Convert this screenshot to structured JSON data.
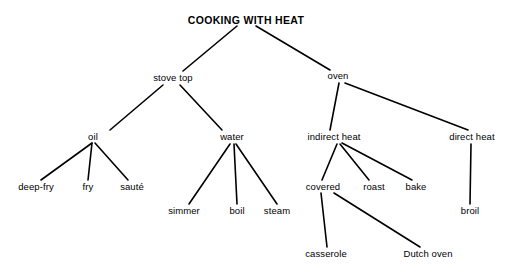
{
  "diagram": {
    "title": "COOKING WITH HEAT",
    "type": "tree-diagram",
    "background_color": "#ffffff",
    "line_color": "#000000",
    "text_color": "#000000",
    "width": 511,
    "height": 274,
    "nodes": [
      {
        "id": "cooking-with-heat",
        "label": "COOKING WITH HEAT",
        "level": 0,
        "x": 246,
        "y": 20,
        "anchor_x": 237,
        "anchor_y": 26
      },
      {
        "id": "stove-top",
        "label": "stove top",
        "level": 1,
        "x": 173,
        "y": 78,
        "anchor_x": 183,
        "anchor_y": 71,
        "parent_anchor_x": 163,
        "parent_anchor_y": 85
      },
      {
        "id": "oven",
        "label": "oven",
        "level": 1,
        "x": 338,
        "y": 76,
        "anchor_x": 330,
        "anchor_y": 70,
        "parent_anchor_x": 339,
        "parent_anchor_y": 83
      },
      {
        "id": "oil",
        "label": "oil",
        "level": 2,
        "x": 93,
        "y": 137,
        "anchor_x": 110,
        "anchor_y": 130,
        "parent_anchor_x": 92,
        "parent_anchor_y": 143
      },
      {
        "id": "water",
        "label": "water",
        "level": 2,
        "x": 232,
        "y": 137,
        "anchor_x": 222,
        "anchor_y": 130,
        "parent_anchor_x": 232,
        "parent_anchor_y": 144
      },
      {
        "id": "indirect-heat",
        "label": "indirect heat",
        "level": 2,
        "x": 334,
        "y": 137,
        "anchor_x": 330,
        "anchor_y": 130,
        "parent_anchor_x": 337,
        "parent_anchor_y": 144
      },
      {
        "id": "direct-heat",
        "label": "direct heat",
        "level": 2,
        "x": 472,
        "y": 137,
        "anchor_x": 462,
        "anchor_y": 130,
        "parent_anchor_x": 472,
        "parent_anchor_y": 144
      },
      {
        "id": "deep-fry",
        "label": "deep-fry",
        "level": 3,
        "x": 36,
        "y": 187,
        "anchor_x": 41,
        "anchor_y": 180
      },
      {
        "id": "fry",
        "label": "fry",
        "level": 3,
        "x": 88,
        "y": 187,
        "anchor_x": 88,
        "anchor_y": 180
      },
      {
        "id": "saute",
        "label": "sauté",
        "level": 3,
        "x": 132,
        "y": 187,
        "anchor_x": 128,
        "anchor_y": 180
      },
      {
        "id": "simmer",
        "label": "simmer",
        "level": 3,
        "x": 184,
        "y": 211,
        "anchor_x": 189,
        "anchor_y": 204
      },
      {
        "id": "boil",
        "label": "boil",
        "level": 3,
        "x": 237,
        "y": 211,
        "anchor_x": 237,
        "anchor_y": 204
      },
      {
        "id": "steam",
        "label": "steam",
        "level": 3,
        "x": 277,
        "y": 211,
        "anchor_x": 277,
        "anchor_y": 204
      },
      {
        "id": "covered",
        "label": "covered",
        "level": 3,
        "x": 323,
        "y": 187,
        "anchor_x": 323,
        "anchor_y": 180,
        "parent_anchor_x": 322,
        "parent_anchor_y": 193
      },
      {
        "id": "roast",
        "label": "roast",
        "level": 3,
        "x": 374,
        "y": 187,
        "anchor_x": 369,
        "anchor_y": 180
      },
      {
        "id": "bake",
        "label": "bake",
        "level": 3,
        "x": 416,
        "y": 187,
        "anchor_x": 412,
        "anchor_y": 180
      },
      {
        "id": "broil",
        "label": "broil",
        "level": 3,
        "x": 470,
        "y": 211,
        "anchor_x": 470,
        "anchor_y": 204
      },
      {
        "id": "casserole",
        "label": "casserole",
        "level": 4,
        "x": 326,
        "y": 254,
        "anchor_x": 327,
        "anchor_y": 247
      },
      {
        "id": "dutch-oven",
        "label": "Dutch oven",
        "level": 4,
        "x": 428,
        "y": 254,
        "anchor_x": 420,
        "anchor_y": 247
      }
    ],
    "edges": [
      {
        "from": "cooking-with-heat",
        "to": "stove-top",
        "x1": 237,
        "y1": 26,
        "x2": 183,
        "y2": 71
      },
      {
        "from": "cooking-with-heat",
        "to": "oven",
        "x1": 256,
        "y1": 26,
        "x2": 330,
        "y2": 70
      },
      {
        "from": "stove-top",
        "to": "oil",
        "x1": 163,
        "y1": 85,
        "x2": 110,
        "y2": 130
      },
      {
        "from": "stove-top",
        "to": "water",
        "x1": 180,
        "y1": 85,
        "x2": 222,
        "y2": 130
      },
      {
        "from": "oil",
        "to": "deep-fry",
        "x1": 92,
        "y1": 143,
        "x2": 41,
        "y2": 180
      },
      {
        "from": "oil",
        "to": "fry",
        "x1": 92,
        "y1": 143,
        "x2": 88,
        "y2": 180
      },
      {
        "from": "oil",
        "to": "saute",
        "x1": 95,
        "y1": 143,
        "x2": 128,
        "y2": 180
      },
      {
        "from": "water",
        "to": "simmer",
        "x1": 230,
        "y1": 144,
        "x2": 189,
        "y2": 204
      },
      {
        "from": "water",
        "to": "boil",
        "x1": 234,
        "y1": 144,
        "x2": 237,
        "y2": 204
      },
      {
        "from": "water",
        "to": "steam",
        "x1": 236,
        "y1": 144,
        "x2": 277,
        "y2": 204
      },
      {
        "from": "oven",
        "to": "indirect-heat",
        "x1": 339,
        "y1": 83,
        "x2": 330,
        "y2": 130
      },
      {
        "from": "oven",
        "to": "direct-heat",
        "x1": 345,
        "y1": 83,
        "x2": 468,
        "y2": 130
      },
      {
        "from": "indirect-heat",
        "to": "covered",
        "x1": 337,
        "y1": 144,
        "x2": 322,
        "y2": 180
      },
      {
        "from": "indirect-heat",
        "to": "roast",
        "x1": 340,
        "y1": 144,
        "x2": 369,
        "y2": 180
      },
      {
        "from": "indirect-heat",
        "to": "bake",
        "x1": 342,
        "y1": 143,
        "x2": 412,
        "y2": 180
      },
      {
        "from": "direct-heat",
        "to": "broil",
        "x1": 471,
        "y1": 144,
        "x2": 470,
        "y2": 204
      },
      {
        "from": "covered",
        "to": "casserole",
        "x1": 321,
        "y1": 193,
        "x2": 327,
        "y2": 247
      },
      {
        "from": "covered",
        "to": "dutch-oven",
        "x1": 334,
        "y1": 193,
        "x2": 420,
        "y2": 247
      }
    ]
  }
}
